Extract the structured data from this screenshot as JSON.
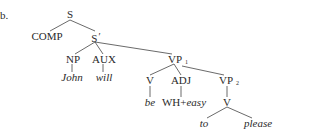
{
  "example_label": "b.",
  "tree": {
    "S": "S",
    "COMP": "COMP",
    "S_bar": "S",
    "S_bar_prime": "′",
    "NP": "NP",
    "AUX": "AUX",
    "John": "John",
    "will": "will",
    "VP1": "VP",
    "VP1_sub": "1",
    "V1": "V",
    "ADJ": "ADJ",
    "VP2": "VP",
    "VP2_sub": "2",
    "be": "be",
    "WH": "WH+",
    "easy": "easy",
    "V2": "V",
    "to": "to",
    "please": "please"
  }
}
